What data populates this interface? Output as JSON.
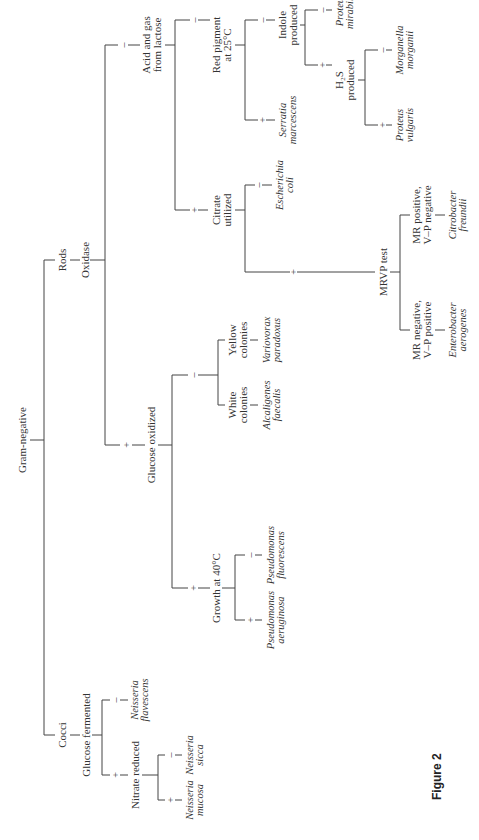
{
  "figure_label": "Figure 2",
  "key": {
    "root": "Gram-negative",
    "cocci": {
      "label": "Cocci",
      "test": "Glucose fermented",
      "plus": {
        "test": "Nitrate reduced",
        "plus": {
          "organism": [
            "Neisseria",
            "mucosa"
          ]
        },
        "minus": {
          "organism": [
            "Neisseria",
            "sicca"
          ]
        }
      },
      "minus": {
        "organism": [
          "Neisseria",
          "flavescens"
        ]
      }
    },
    "rods": {
      "label": "Rods",
      "test": "Oxidase",
      "plus": {
        "test": "Glucose oxidized",
        "plus": {
          "test": "Growth at 40°C",
          "plus": {
            "organism": [
              "Pseudomonas",
              "aeruginosa"
            ]
          },
          "minus": {
            "organism": [
              "Pseudomonas",
              "fluorescens"
            ]
          }
        },
        "minus": {
          "white": {
            "test": [
              "White",
              "colonies"
            ],
            "organism": [
              "Alcaligenes",
              "faecalis"
            ]
          },
          "yellow": {
            "test": [
              "Yellow",
              "colonies"
            ],
            "organism": [
              "Variovorax",
              "paradoxus"
            ]
          }
        }
      },
      "minus": {
        "test": [
          "Acid and gas",
          "from lactose"
        ],
        "plus": {
          "test": [
            "Citrate",
            "utilized"
          ],
          "plus": {
            "test": "MRVP test",
            "mr_neg": {
              "test": [
                "MR negative,",
                "V–P positive"
              ],
              "organism": [
                "Enterobacter",
                "aerogenes"
              ]
            },
            "mr_pos": {
              "test": [
                "MR positive,",
                "V–P negative"
              ],
              "organism": [
                "Citrobacter",
                "freundii"
              ]
            }
          },
          "minus": {
            "organism": [
              "Escherichia",
              "coli"
            ]
          }
        },
        "minus": {
          "test": [
            "Red pigment",
            "at 25°C"
          ],
          "plus": {
            "organism": [
              "Serratia",
              "marcescens"
            ]
          },
          "minus": {
            "test": [
              "Indole",
              "produced"
            ],
            "plus": {
              "test": [
                "H₂S",
                "produced"
              ],
              "plus": {
                "organism": [
                  "Proteus",
                  "vulgaris"
                ]
              },
              "minus": {
                "organism": [
                  "Morganella",
                  "morganii"
                ]
              }
            },
            "minus": {
              "organism": [
                "Proteus",
                "mirabilis"
              ]
            }
          }
        }
      }
    }
  },
  "signs": {
    "plus": "+",
    "minus": "–"
  }
}
